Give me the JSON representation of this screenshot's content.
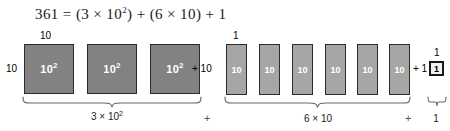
{
  "equation": {
    "text": "361 = (3 × 10",
    "full": "361 = (3 × 10²) + (6 × 10) + 1",
    "lhs": "361",
    "eq": "=",
    "term1_open": "(3 × 10",
    "term1_exp": "2",
    "term1_close": ")",
    "plus1": "+",
    "term2": "(6 × 10)",
    "plus2": "+",
    "term3": "1"
  },
  "hundreds": {
    "top_dimension": "10",
    "left_dimension": "10",
    "block_label": "10",
    "block_exponent": "2",
    "blocks": [
      {
        "label": "10",
        "exponent": "2"
      },
      {
        "label": "10",
        "exponent": "2"
      },
      {
        "label": "10",
        "exponent": "2"
      }
    ],
    "summary": "3 × 10",
    "summary_exponent": "2"
  },
  "tens": {
    "top_dimension": "1",
    "operator_prefix": "+ 10",
    "blocks": [
      {
        "label": "10"
      },
      {
        "label": "10"
      },
      {
        "label": "10"
      },
      {
        "label": "10"
      },
      {
        "label": "10"
      },
      {
        "label": "10"
      }
    ],
    "summary": "6 × 10"
  },
  "units": {
    "top_dimension": "1",
    "operator_prefix": "+ 1",
    "block_label": "1",
    "summary": "1"
  },
  "operators": {
    "between_hundreds_tens": "+",
    "between_tens_units": "+"
  },
  "colors": {
    "hundred_fill": "#828282",
    "ten_fill": "#a6a6a6",
    "unit_fill": "#f2f2f2",
    "block_border": "#2b2b2b",
    "text": "#1a1a1a",
    "block_text": "#ffffff",
    "background": "#ffffff"
  }
}
